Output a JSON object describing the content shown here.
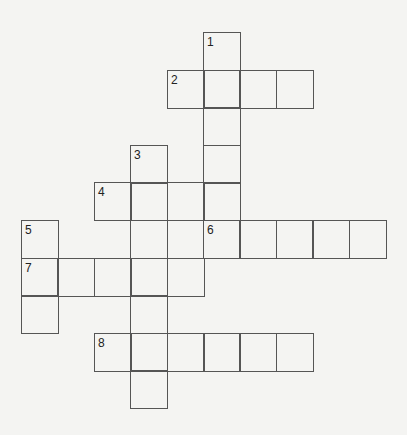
{
  "puzzle": {
    "type": "crossword",
    "cell_size": 37,
    "numbers": [
      {
        "label": "1",
        "col": 5,
        "row": 0
      },
      {
        "label": "2",
        "col": 4,
        "row": 1
      },
      {
        "label": "3",
        "col": 3,
        "row": 3
      },
      {
        "label": "4",
        "col": 2,
        "row": 4
      },
      {
        "label": "5",
        "col": 0,
        "row": 5
      },
      {
        "label": "6",
        "col": 5,
        "row": 5
      },
      {
        "label": "7",
        "col": 0,
        "row": 6
      },
      {
        "label": "8",
        "col": 2,
        "row": 8
      }
    ],
    "entries": [
      {
        "label": "1",
        "direction": "down",
        "col": 5,
        "row": 0,
        "length": 6
      },
      {
        "label": "2",
        "direction": "across",
        "col": 4,
        "row": 1,
        "length": 4
      },
      {
        "label": "3",
        "direction": "down",
        "col": 3,
        "row": 3,
        "length": 7
      },
      {
        "label": "4",
        "direction": "across",
        "col": 2,
        "row": 4,
        "length": 4
      },
      {
        "label": "5",
        "direction": "down",
        "col": 0,
        "row": 5,
        "length": 3
      },
      {
        "label": "6",
        "direction": "across",
        "col": 5,
        "row": 5,
        "length": 5
      },
      {
        "label": "7",
        "direction": "across",
        "col": 0,
        "row": 6,
        "length": 5
      },
      {
        "label": "8",
        "direction": "across",
        "col": 2,
        "row": 8,
        "length": 6
      }
    ]
  }
}
